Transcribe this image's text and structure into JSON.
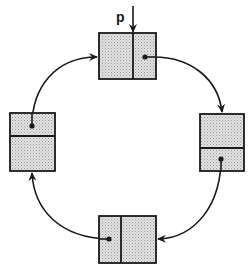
{
  "diagram": {
    "pointer_label": "p",
    "colors": {
      "stroke": "#1a1a1a",
      "fill": "#d4d4d4",
      "background": "#ffffff"
    },
    "nodes": [
      {
        "id": "top",
        "x": 99,
        "y": 33,
        "w": 57,
        "h": 46,
        "divider": "vertical",
        "divider_pos": 133,
        "pointer_dot": [
          154,
          57
        ]
      },
      {
        "id": "right",
        "x": 200,
        "y": 114,
        "w": 44,
        "h": 57,
        "divider": "horizontal",
        "divider_pos": 148,
        "pointer_dot": [
          221,
          155
        ]
      },
      {
        "id": "bottom",
        "x": 99,
        "y": 216,
        "w": 57,
        "h": 47,
        "divider": "vertical",
        "divider_pos": 121,
        "pointer_dot": [
          109,
          239
        ]
      },
      {
        "id": "left",
        "x": 10,
        "y": 113,
        "w": 45,
        "h": 58,
        "divider": "horizontal",
        "divider_pos": 136,
        "pointer_dot": [
          32,
          126
        ]
      }
    ],
    "links": [
      {
        "from": "top",
        "to": "right"
      },
      {
        "from": "right",
        "to": "bottom"
      },
      {
        "from": "bottom",
        "to": "left"
      },
      {
        "from": "left",
        "to": "top"
      }
    ]
  }
}
